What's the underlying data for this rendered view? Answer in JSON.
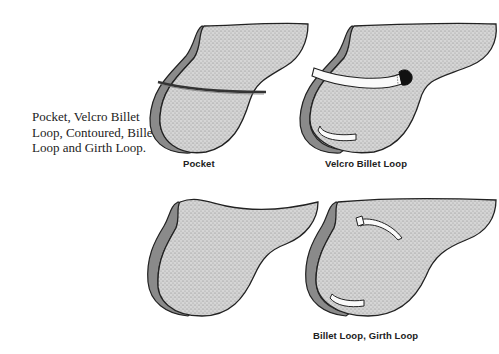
{
  "side_caption": "Pocket, Velcro Billet Loop, Contoured, Billet Loop and Girth Loop.",
  "pads": [
    {
      "id": "pocket",
      "label": "Pocket",
      "features": [
        "pocket-slit"
      ]
    },
    {
      "id": "velcro-billet-loop",
      "label": "Velcro Billet Loop",
      "features": [
        "velcro-billet-strap",
        "girth-loop"
      ]
    },
    {
      "id": "contoured",
      "label": "",
      "features": []
    },
    {
      "id": "billet-loop-girth-loop",
      "label": "Billet Loop, Girth Loop",
      "features": [
        "billet-loop",
        "girth-loop"
      ]
    }
  ],
  "colors": {
    "pad_fill": "#cfcfcf",
    "outline": "#222222",
    "edge_roll": "#8a8a8a",
    "background": "#ffffff"
  }
}
